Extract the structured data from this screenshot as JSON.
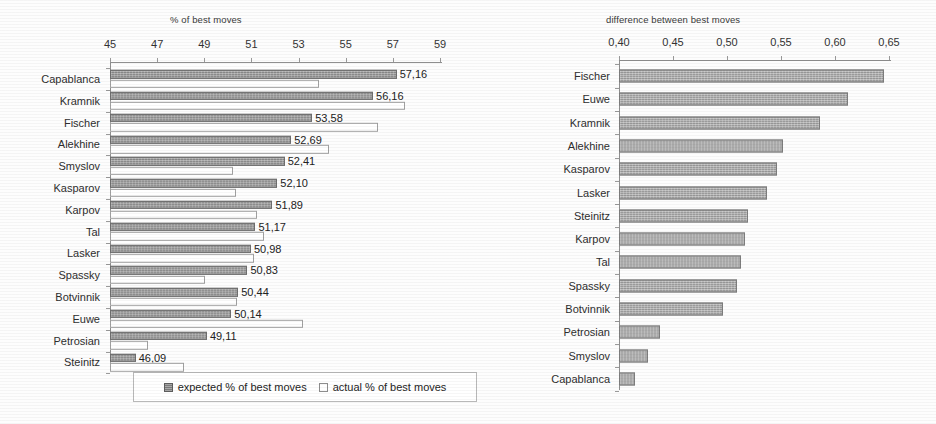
{
  "chart_data": [
    {
      "type": "bar",
      "orientation": "horizontal",
      "title": "% of best moves",
      "xlabel": "",
      "ylabel": "",
      "xlim": [
        45,
        59
      ],
      "xticks": [
        45,
        47,
        49,
        51,
        53,
        55,
        57,
        59
      ],
      "xtick_labels": [
        "45",
        "47",
        "49",
        "51",
        "53",
        "55",
        "57",
        "59"
      ],
      "grid": false,
      "legend_position": "bottom",
      "categories": [
        "Capablanca",
        "Kramnik",
        "Fischer",
        "Alekhine",
        "Smyslov",
        "Kasparov",
        "Karpov",
        "Tal",
        "Lasker",
        "Spassky",
        "Botvinnik",
        "Euwe",
        "Petrosian",
        "Steinitz"
      ],
      "series": [
        {
          "name": "expected % of best moves",
          "color": "#8a8a8a",
          "values": [
            57.16,
            56.16,
            53.58,
            52.69,
            52.41,
            52.1,
            51.89,
            51.17,
            50.98,
            50.83,
            50.44,
            50.14,
            49.11,
            46.09
          ],
          "data_labels": [
            "57,16",
            "56,16",
            "53,58",
            "52,69",
            "52,41",
            "52,10",
            "51,89",
            "51,17",
            "50,98",
            "50,83",
            "50,44",
            "50,14",
            "49,11",
            "46,09"
          ]
        },
        {
          "name": "actual % of best moves",
          "color": "#ffffff",
          "values": [
            53.85,
            57.5,
            56.35,
            54.3,
            50.2,
            50.35,
            51.25,
            51.55,
            51.1,
            49.05,
            50.4,
            53.2,
            46.6,
            48.15
          ],
          "data_labels": []
        }
      ]
    },
    {
      "type": "bar",
      "orientation": "horizontal",
      "title": "difference between best moves",
      "xlabel": "",
      "ylabel": "",
      "xlim": [
        0.4,
        0.65
      ],
      "xticks": [
        0.4,
        0.45,
        0.5,
        0.55,
        0.6,
        0.65
      ],
      "xtick_labels": [
        "0,40",
        "0,45",
        "0,50",
        "0,55",
        "0,60",
        "0,65"
      ],
      "grid": false,
      "legend_position": "none",
      "categories": [
        "Fischer",
        "Euwe",
        "Kramnik",
        "Alekhine",
        "Kasparov",
        "Lasker",
        "Steinitz",
        "Karpov",
        "Tal",
        "Spassky",
        "Botvinnik",
        "Petrosian",
        "Smyslov",
        "Capablanca"
      ],
      "series": [
        {
          "name": "difference between best moves",
          "color": "#9a9a9a",
          "values": [
            0.645,
            0.612,
            0.586,
            0.552,
            0.546,
            0.537,
            0.519,
            0.517,
            0.513,
            0.509,
            0.496,
            0.438,
            0.427,
            0.415
          ],
          "data_labels": []
        }
      ]
    }
  ],
  "legend": {
    "entries": [
      {
        "label": "expected % of best moves",
        "swatch": "filled"
      },
      {
        "label": "actual % of best moves",
        "swatch": "open"
      }
    ]
  }
}
